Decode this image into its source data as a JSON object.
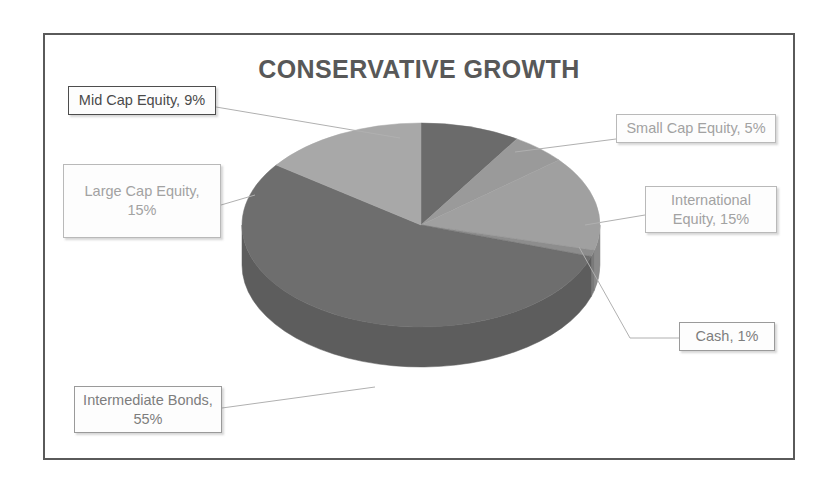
{
  "chart": {
    "title": "CONSERVATIVE GROWTH",
    "frame_border_color": "#5a5a5a",
    "background": "#ffffff",
    "title_color": "#585858"
  },
  "labels": {
    "mid_cap": "Mid Cap Equity, 9%",
    "large_cap": "Large Cap Equity, 15%",
    "small_cap": "Small Cap Equity, 5%",
    "international": "International Equity, 15%",
    "cash": "Cash, 1%",
    "bonds": "Intermediate Bonds, 55%"
  },
  "chart_data": {
    "type": "pie",
    "title": "CONSERVATIVE GROWTH",
    "xlabel": "",
    "ylabel": "",
    "legend": "none",
    "three_d": true,
    "data_labels": "outside-callout-boxes",
    "categories": [
      "Intermediate Bonds",
      "Large Cap Equity",
      "Mid Cap Equity",
      "Small Cap Equity",
      "International Equity",
      "Cash"
    ],
    "values": [
      55,
      15,
      9,
      5,
      15,
      1
    ],
    "units": "percent",
    "total": 100,
    "slices": [
      {
        "name": "Intermediate Bonds",
        "value": 55,
        "label": "Intermediate Bonds, 55%",
        "color": "#6e6e6e",
        "side_color": "#5d5d5d"
      },
      {
        "name": "Large Cap Equity",
        "value": 15,
        "label": "Large Cap Equity, 15%",
        "color": "#a8a8a8",
        "side_color": "#8f8f8f"
      },
      {
        "name": "Mid Cap Equity",
        "value": 9,
        "label": "Mid Cap Equity, 9%",
        "color": "#6b6b6b",
        "side_color": "#5a5a5a"
      },
      {
        "name": "Small Cap Equity",
        "value": 5,
        "label": "Small Cap Equity, 5%",
        "color": "#9a9a9a",
        "side_color": "#848484"
      },
      {
        "name": "International Equity",
        "value": 15,
        "label": "International Equity, 15%",
        "color": "#a0a0a0",
        "side_color": "#8a8a8a"
      },
      {
        "name": "Cash",
        "value": 1,
        "label": "Cash, 1%",
        "color": "#8d8d8d",
        "side_color": "#7a7a7a"
      }
    ]
  }
}
